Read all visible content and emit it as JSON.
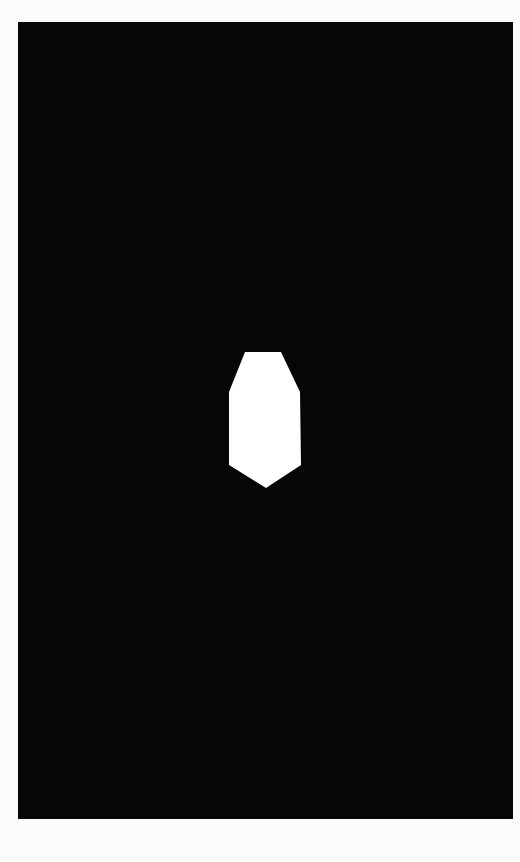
{
  "image": {
    "width": 520,
    "height": 862,
    "border_color": "#fbfbfb",
    "background_color": "#060606"
  },
  "canvas": {
    "x": 18,
    "y": 22,
    "width": 495,
    "height": 797
  },
  "silhouette": {
    "color": "#ffffff",
    "points": "245,352 281,352 300,392 301,465 266,488 229,465 229,392"
  }
}
